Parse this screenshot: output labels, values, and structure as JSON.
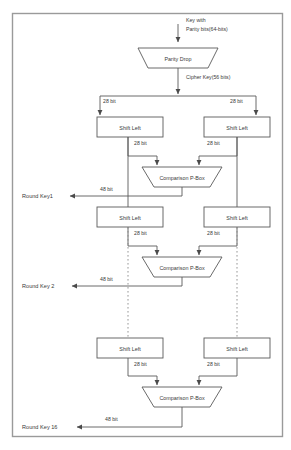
{
  "diagram": {
    "frame": {
      "stroke": "#9a9a9a",
      "fill": "#ffffff"
    },
    "line_color": "#5a5a5a",
    "text_color": "#3a3a3a",
    "input": {
      "line1": "Key with",
      "line2": "Parity bits(64-bits)"
    },
    "parity_drop": {
      "label": "Parity Drop"
    },
    "cipher_key": {
      "label": "Cipher Key(56 bits)"
    },
    "bit28": "28 bit",
    "bit48": "48 bit",
    "shift_left": {
      "label": "Shift Left"
    },
    "comparison_pbox": {
      "label": "Comparison P-Box"
    },
    "rounds": [
      {
        "key_label": "Round Key1"
      },
      {
        "key_label": "Round Key 2"
      },
      {
        "key_label": "Round Key 16"
      }
    ],
    "stage_labels": {
      "left_branch_bits": "28 bit",
      "right_branch_bits": "28 bit",
      "output_bits": "48 bit"
    }
  }
}
